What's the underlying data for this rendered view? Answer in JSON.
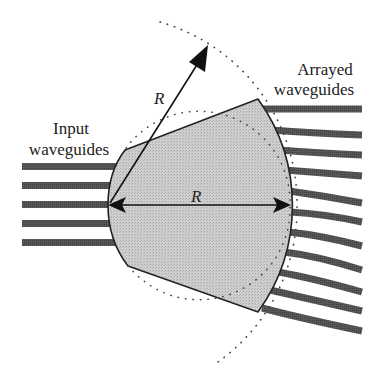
{
  "labels": {
    "input_line1": "Input",
    "input_line2": "waveguides",
    "arrayed_line1": "Arrayed",
    "arrayed_line2": "waveguides",
    "radius_diagonal": "R",
    "radius_horizontal": "R"
  },
  "colors": {
    "slab_fill": "#c8c8c8",
    "waveguide": "#555555",
    "outline": "#222222",
    "dots": "#444444"
  },
  "geometry": {
    "input_waveguide_count": 5,
    "arrayed_waveguide_count": 11
  }
}
